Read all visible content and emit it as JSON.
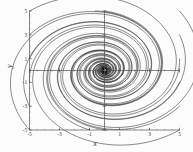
{
  "chart_data": {
    "type": "line",
    "title": "",
    "subtitle": "",
    "xlabel": "x",
    "ylabel": "y",
    "xlim": [
      -5,
      5
    ],
    "ylim": [
      -5,
      5
    ],
    "xticks": [
      -5,
      -3,
      -1,
      1,
      3,
      5
    ],
    "yticks": [
      -5,
      -3,
      -1,
      1,
      3,
      5
    ],
    "xtick_labels": [
      "-5",
      "-3",
      "-1",
      "1",
      "3",
      "5"
    ],
    "ytick_labels": [
      "-5",
      "-3",
      "-1",
      "1",
      "3",
      "5"
    ],
    "minor_ticks": true,
    "grid": false,
    "legend": null,
    "annotations": [],
    "equilibrium": {
      "x": 0,
      "y": 0,
      "kind": "stable-spiral-focus"
    },
    "spiral": {
      "direction": "clockwise",
      "inward": true,
      "decay_per_turn": 0.34,
      "turns": 3.1
    },
    "series": [
      {
        "name": "trajectory-1",
        "start": [
          -5.0,
          5.0
        ],
        "start_angle_deg": 135,
        "start_radius": 7.07
      },
      {
        "name": "trajectory-2",
        "start": [
          -5.0,
          3.0
        ],
        "start_angle_deg": 149,
        "start_radius": 5.83
      },
      {
        "name": "trajectory-3",
        "start": [
          -5.0,
          1.0
        ],
        "start_angle_deg": 169,
        "start_radius": 5.1
      },
      {
        "name": "trajectory-4",
        "start": [
          -5.0,
          -1.0
        ],
        "start_angle_deg": 191,
        "start_radius": 5.1
      },
      {
        "name": "trajectory-5",
        "start": [
          -5.0,
          -3.0
        ],
        "start_angle_deg": 211,
        "start_radius": 5.83
      },
      {
        "name": "trajectory-6",
        "start": [
          -5.0,
          -5.0
        ],
        "start_angle_deg": 225,
        "start_radius": 7.07
      },
      {
        "name": "trajectory-7",
        "start": [
          -1.0,
          -5.0
        ],
        "start_angle_deg": 259,
        "start_radius": 5.1
      },
      {
        "name": "trajectory-8",
        "start": [
          0.2,
          -5.0
        ],
        "start_angle_deg": 272,
        "start_radius": 5.0
      },
      {
        "name": "trajectory-9",
        "start": [
          5.0,
          -5.0
        ],
        "start_angle_deg": 315,
        "start_radius": 7.07
      },
      {
        "name": "trajectory-10",
        "start": [
          5.0,
          -3.0
        ],
        "start_angle_deg": 329,
        "start_radius": 5.83
      },
      {
        "name": "trajectory-11",
        "start": [
          5.0,
          -1.0
        ],
        "start_angle_deg": 349,
        "start_radius": 5.1
      },
      {
        "name": "trajectory-12",
        "start": [
          5.0,
          1.0
        ],
        "start_angle_deg": 11,
        "start_radius": 5.1
      },
      {
        "name": "trajectory-13",
        "start": [
          5.0,
          3.0
        ],
        "start_angle_deg": 31,
        "start_radius": 5.83
      },
      {
        "name": "trajectory-14",
        "start": [
          5.0,
          5.0
        ],
        "start_angle_deg": 45,
        "start_radius": 7.07
      },
      {
        "name": "trajectory-15",
        "start": [
          0.0,
          5.0
        ],
        "start_angle_deg": 90,
        "start_radius": 5.0
      },
      {
        "name": "trajectory-16",
        "start": [
          -0.6,
          5.0
        ],
        "start_angle_deg": 97,
        "start_radius": 5.04
      }
    ],
    "style": {
      "line_color": "#2b2b2b",
      "line_width": 0.55,
      "axis_color": "#555555",
      "background": "#fdfdfd"
    }
  }
}
